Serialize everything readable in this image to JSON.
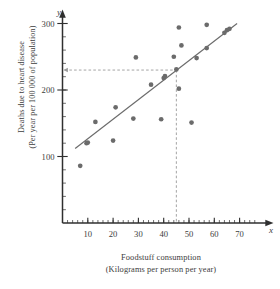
{
  "chart_data": {
    "type": "scatter",
    "title": "",
    "xlabel": "Foodstuff consumption",
    "xlabel_sub": "(Kilograms per person per year)",
    "ylabel": "Deaths due to heart disease",
    "ylabel_sub": "(Per year per 100 000 of population)",
    "x_axis_name": "x",
    "y_axis_name": "y",
    "xlim": [
      0,
      76
    ],
    "ylim": [
      0,
      320
    ],
    "x_ticks": [
      10,
      20,
      30,
      40,
      50,
      60,
      70
    ],
    "y_ticks": [
      100,
      200,
      300
    ],
    "x_minor_step": 2,
    "y_minor_step": 20,
    "grid": false,
    "legend": false,
    "point_color": "#6b6b6b",
    "line_color": "#6b6b6b",
    "guide_color": "#9a9a9a",
    "axis_color": "#2f2f2f",
    "points": [
      {
        "x": 7,
        "y": 86
      },
      {
        "x": 9.5,
        "y": 120
      },
      {
        "x": 10,
        "y": 121
      },
      {
        "x": 13,
        "y": 152
      },
      {
        "x": 20,
        "y": 124
      },
      {
        "x": 21,
        "y": 174
      },
      {
        "x": 28,
        "y": 157
      },
      {
        "x": 29,
        "y": 249
      },
      {
        "x": 35,
        "y": 208
      },
      {
        "x": 39,
        "y": 156
      },
      {
        "x": 40,
        "y": 218
      },
      {
        "x": 40.5,
        "y": 221
      },
      {
        "x": 44,
        "y": 250
      },
      {
        "x": 45,
        "y": 231
      },
      {
        "x": 46,
        "y": 294
      },
      {
        "x": 46,
        "y": 202
      },
      {
        "x": 47,
        "y": 267
      },
      {
        "x": 51,
        "y": 151
      },
      {
        "x": 53,
        "y": 248
      },
      {
        "x": 57,
        "y": 263
      },
      {
        "x": 57,
        "y": 298
      },
      {
        "x": 64,
        "y": 286
      },
      {
        "x": 65,
        "y": 290
      },
      {
        "x": 66,
        "y": 292
      }
    ],
    "trend_line": {
      "x1": 5,
      "y1": 112,
      "x2": 69,
      "y2": 300
    },
    "guides": {
      "vertical_x": 45,
      "horizontal_y": 230,
      "arrow_to_axis": true
    }
  }
}
